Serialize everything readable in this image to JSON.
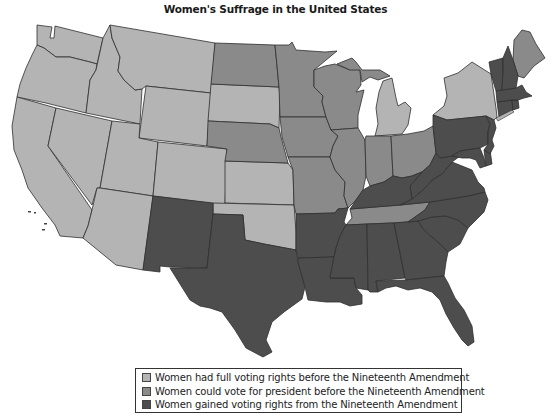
{
  "title": "Women's Suffrage in the United States",
  "colors": {
    "full": "#b4b4b4",
    "president": "#8a8a8a",
    "nineteenth": "#4d4d4d",
    "border": "#2f2f2f",
    "background": "#ffffff"
  },
  "legend": [
    {
      "category": "full",
      "label": "Women had full voting rights before the Nineteenth Amendment",
      "color": "#b4b4b4"
    },
    {
      "category": "president",
      "label": "Women could vote for president before the Nineteenth Amendment",
      "color": "#8a8a8a"
    },
    {
      "category": "nineteenth",
      "label": "Women gained voting rights from the Nineteenth Amendment",
      "color": "#4d4d4d"
    }
  ],
  "states": {
    "full": [
      "Washington",
      "Oregon",
      "California",
      "Idaho",
      "Nevada",
      "Montana",
      "Wyoming",
      "Utah",
      "Arizona",
      "Colorado",
      "South Dakota",
      "Kansas",
      "Oklahoma",
      "Michigan",
      "New York"
    ],
    "president": [
      "North Dakota",
      "Minnesota",
      "Nebraska",
      "Iowa",
      "Missouri",
      "Wisconsin",
      "Illinois",
      "Indiana",
      "Ohio",
      "Maine",
      "Tennessee"
    ],
    "nineteenth": [
      "New Mexico",
      "Texas",
      "Arkansas",
      "Louisiana",
      "Mississippi",
      "Alabama",
      "Georgia",
      "Florida",
      "South Carolina",
      "North Carolina",
      "Virginia",
      "West Virginia",
      "Kentucky",
      "Maryland",
      "Delaware",
      "Pennsylvania",
      "New Jersey",
      "Connecticut",
      "Rhode Island",
      "Massachusetts",
      "Vermont",
      "New Hampshire"
    ]
  }
}
